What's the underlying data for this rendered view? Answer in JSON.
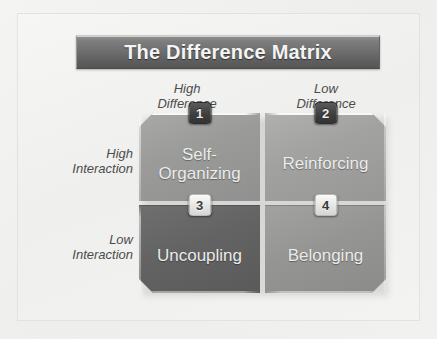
{
  "title": {
    "text": "The Difference Matrix"
  },
  "axes": {
    "columns": [
      {
        "line1": "High",
        "line2": "Difference"
      },
      {
        "line1": "Low",
        "line2": "Difference"
      }
    ],
    "rows": [
      {
        "line1": "High",
        "line2": "Interaction"
      },
      {
        "line1": "Low",
        "line2": "Interaction"
      }
    ]
  },
  "quadrants": [
    {
      "number": "1",
      "label": "Self-Organizing",
      "badge_style": "dark",
      "position": "high-interaction-high-difference"
    },
    {
      "number": "2",
      "label": "Reinforcing",
      "badge_style": "dark",
      "position": "high-interaction-low-difference"
    },
    {
      "number": "3",
      "label": "Uncoupling",
      "badge_style": "light",
      "position": "low-interaction-high-difference"
    },
    {
      "number": "4",
      "label": "Belonging",
      "badge_style": "light",
      "position": "low-interaction-low-difference"
    }
  ],
  "colors": {
    "background": "#f2f2f0",
    "title_bar_top": "#8e8e8e",
    "title_bar_bottom": "#565656",
    "title_text": "#f4f4f4",
    "axis_label_text": "#4c4c4c",
    "quadrant_1": "#9b9b99",
    "quadrant_2": "#a2a2a0",
    "quadrant_3": "#636363",
    "quadrant_4": "#959593",
    "quadrant_label_text": "#ececeb",
    "badge_dark_bg": "#3d3d3d",
    "badge_light_bg": "#e3e3e1"
  }
}
